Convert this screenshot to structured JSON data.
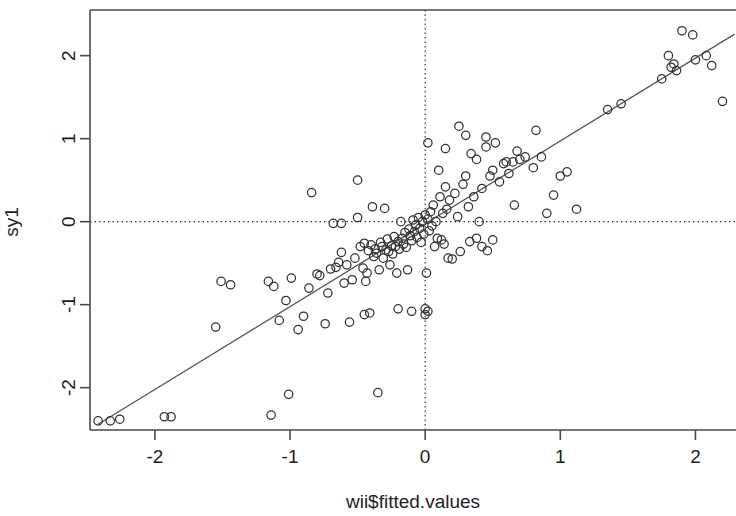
{
  "chart_data": {
    "type": "scatter",
    "title": "",
    "xlabel": "wii$fitted.values",
    "ylabel": "sy1",
    "xlim": [
      -2.48,
      2.3
    ],
    "ylim": [
      -2.51,
      2.55
    ],
    "xticks": [
      -2,
      -1,
      0,
      1,
      2
    ],
    "xticklabels": [
      "-2",
      "-1",
      "0",
      "1",
      "2"
    ],
    "yticks": [
      -2,
      -1,
      0,
      1,
      2
    ],
    "yticklabels": [
      "-2",
      "-1",
      "0",
      "1",
      "2"
    ],
    "grid": false,
    "legend": null,
    "point_marker": "open-circle",
    "point_color": "#333333",
    "point_radius": 4.2,
    "reference_lines": [
      {
        "name": "vertical-zero-line",
        "orientation": "vertical",
        "value": 0,
        "style": "dotted",
        "color": "#333333"
      },
      {
        "name": "horizontal-zero-line",
        "orientation": "horizontal",
        "value": 0,
        "style": "dotted",
        "color": "#333333"
      }
    ],
    "fit_line": {
      "name": "regression-line",
      "style": "solid",
      "color": "#555555",
      "x_start": -2.42,
      "y_start": -2.44,
      "x_end": 2.29,
      "y_end": 2.26,
      "slope": 1.0,
      "intercept": 0.0
    },
    "points": [
      [
        -2.42,
        -2.4
      ],
      [
        -2.33,
        -2.4
      ],
      [
        -2.26,
        -2.38
      ],
      [
        -1.93,
        -2.35
      ],
      [
        -1.88,
        -2.35
      ],
      [
        -1.55,
        -1.27
      ],
      [
        -1.51,
        -0.72
      ],
      [
        -1.44,
        -0.76
      ],
      [
        -1.16,
        -0.72
      ],
      [
        -1.12,
        -0.78
      ],
      [
        -1.14,
        -2.33
      ],
      [
        -1.08,
        -1.19
      ],
      [
        -1.03,
        -0.95
      ],
      [
        -1.01,
        -2.08
      ],
      [
        -0.99,
        -0.68
      ],
      [
        -0.94,
        -1.3
      ],
      [
        -0.9,
        -1.14
      ],
      [
        -0.86,
        -0.8
      ],
      [
        -0.84,
        0.35
      ],
      [
        -0.8,
        -0.63
      ],
      [
        -0.78,
        -0.65
      ],
      [
        -0.74,
        -1.23
      ],
      [
        -0.72,
        -0.86
      ],
      [
        -0.7,
        -0.57
      ],
      [
        -0.68,
        -0.02
      ],
      [
        -0.66,
        -0.55
      ],
      [
        -0.64,
        -0.49
      ],
      [
        -0.62,
        -0.37
      ],
      [
        -0.6,
        -0.74
      ],
      [
        -0.58,
        -0.52
      ],
      [
        -0.56,
        -1.21
      ],
      [
        -0.54,
        -0.7
      ],
      [
        -0.52,
        -0.44
      ],
      [
        -0.5,
        0.5
      ],
      [
        -0.48,
        -0.3
      ],
      [
        -0.46,
        -0.56
      ],
      [
        -0.45,
        -0.26
      ],
      [
        -0.44,
        -0.72
      ],
      [
        -0.43,
        -0.62
      ],
      [
        -0.42,
        -0.35
      ],
      [
        -0.41,
        -1.1
      ],
      [
        -0.4,
        -0.28
      ],
      [
        -0.39,
        0.18
      ],
      [
        -0.38,
        -0.42
      ],
      [
        -0.37,
        -0.33
      ],
      [
        -0.36,
        -0.38
      ],
      [
        -0.35,
        -2.06
      ],
      [
        -0.34,
        -0.58
      ],
      [
        -0.33,
        -0.25
      ],
      [
        -0.32,
        -0.3
      ],
      [
        -0.31,
        -0.44
      ],
      [
        -0.3,
        0.16
      ],
      [
        -0.29,
        -0.34
      ],
      [
        -0.28,
        -0.21
      ],
      [
        -0.27,
        -0.36
      ],
      [
        -0.26,
        -0.52
      ],
      [
        -0.25,
        -0.29
      ],
      [
        -0.24,
        -0.39
      ],
      [
        -0.23,
        -0.18
      ],
      [
        -0.22,
        -0.3
      ],
      [
        -0.21,
        -0.62
      ],
      [
        -0.2,
        -0.24
      ],
      [
        -0.19,
        -0.33
      ],
      [
        -0.18,
        0.0
      ],
      [
        -0.17,
        -0.2
      ],
      [
        -0.16,
        -0.27
      ],
      [
        -0.15,
        -0.13
      ],
      [
        -0.14,
        -0.31
      ],
      [
        -0.13,
        -0.58
      ],
      [
        -0.12,
        -0.09
      ],
      [
        -0.11,
        -0.17
      ],
      [
        -0.1,
        -0.23
      ],
      [
        -0.09,
        0.02
      ],
      [
        -0.08,
        -0.12
      ],
      [
        -0.07,
        -0.04
      ],
      [
        -0.06,
        -0.19
      ],
      [
        -0.05,
        0.05
      ],
      [
        -0.04,
        -0.08
      ],
      [
        -0.03,
        -0.25
      ],
      [
        -0.02,
        0.0
      ],
      [
        -0.01,
        -0.15
      ],
      [
        0.0,
        0.08
      ],
      [
        0.0,
        -1.12
      ],
      [
        0.01,
        -0.62
      ],
      [
        0.02,
        0.03
      ],
      [
        0.03,
        -0.11
      ],
      [
        0.04,
        0.12
      ],
      [
        0.05,
        -0.05
      ],
      [
        0.06,
        0.2
      ],
      [
        0.07,
        -0.3
      ],
      [
        0.08,
        0.0
      ],
      [
        0.09,
        -0.2
      ],
      [
        0.1,
        0.62
      ],
      [
        0.11,
        0.3
      ],
      [
        0.12,
        -0.22
      ],
      [
        0.13,
        0.1
      ],
      [
        0.14,
        -0.27
      ],
      [
        0.15,
        0.42
      ],
      [
        0.16,
        0.15
      ],
      [
        0.17,
        -0.44
      ],
      [
        0.18,
        0.26
      ],
      [
        0.2,
        -0.45
      ],
      [
        0.22,
        0.34
      ],
      [
        0.24,
        0.06
      ],
      [
        0.25,
        1.15
      ],
      [
        0.26,
        -0.36
      ],
      [
        0.28,
        0.45
      ],
      [
        0.3,
        0.55
      ],
      [
        0.32,
        0.18
      ],
      [
        0.34,
        0.82
      ],
      [
        0.36,
        0.3
      ],
      [
        0.38,
        0.75
      ],
      [
        0.4,
        0.0
      ],
      [
        0.42,
        0.4
      ],
      [
        0.45,
        0.9
      ],
      [
        0.48,
        0.55
      ],
      [
        0.5,
        0.62
      ],
      [
        0.52,
        0.95
      ],
      [
        0.55,
        0.48
      ],
      [
        0.58,
        0.7
      ],
      [
        0.6,
        0.72
      ],
      [
        0.62,
        0.58
      ],
      [
        0.65,
        0.72
      ],
      [
        0.66,
        0.2
      ],
      [
        0.68,
        0.85
      ],
      [
        0.7,
        0.75
      ],
      [
        0.74,
        0.78
      ],
      [
        0.8,
        0.65
      ],
      [
        0.86,
        0.78
      ],
      [
        0.9,
        0.1
      ],
      [
        0.95,
        0.32
      ],
      [
        1.0,
        0.55
      ],
      [
        1.05,
        0.6
      ],
      [
        1.12,
        0.15
      ],
      [
        1.35,
        1.35
      ],
      [
        1.45,
        1.42
      ],
      [
        1.75,
        1.72
      ],
      [
        1.8,
        2.0
      ],
      [
        1.82,
        1.86
      ],
      [
        1.84,
        1.9
      ],
      [
        1.86,
        1.82
      ],
      [
        1.9,
        2.3
      ],
      [
        1.98,
        2.25
      ],
      [
        2.0,
        1.95
      ],
      [
        2.08,
        2.0
      ],
      [
        2.12,
        1.88
      ],
      [
        2.2,
        1.45
      ],
      [
        0.82,
        1.1
      ],
      [
        0.45,
        1.02
      ],
      [
        0.3,
        1.04
      ],
      [
        0.02,
        0.95
      ],
      [
        0.15,
        0.88
      ],
      [
        -0.5,
        0.05
      ],
      [
        -0.62,
        -0.02
      ],
      [
        0.38,
        -0.2
      ],
      [
        0.42,
        -0.3
      ],
      [
        0.46,
        -0.35
      ],
      [
        0.5,
        -0.22
      ],
      [
        0.33,
        -0.24
      ],
      [
        -0.45,
        -1.12
      ],
      [
        -0.2,
        -1.05
      ],
      [
        -0.1,
        -1.08
      ],
      [
        0.0,
        -1.05
      ],
      [
        0.02,
        -1.08
      ]
    ]
  },
  "axes": {
    "x_label": "wii$fitted.values",
    "y_label": "sy1"
  }
}
